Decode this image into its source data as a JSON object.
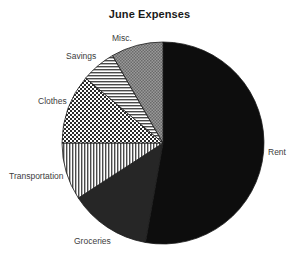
{
  "chart_data": {
    "type": "pie",
    "title": "June Expenses",
    "xlabel": "",
    "ylabel": "",
    "legend_position": "none",
    "grid": false,
    "start_angle_deg": 90,
    "direction": "clockwise",
    "categories": [
      "Rent",
      "Groceries",
      "Transportation",
      "Clothes",
      "Savings",
      "Misc."
    ],
    "values": [
      52.8,
      13.1,
      9.2,
      11.1,
      5.6,
      8.2
    ],
    "value_unit": "percent",
    "slices": [
      {
        "label": "Rent",
        "value": 52.8,
        "start_deg": 0,
        "end_deg": 190,
        "fill": "solid-black",
        "color": "#0d0d0d",
        "label_side": "right"
      },
      {
        "label": "Groceries",
        "value": 13.1,
        "start_deg": 190,
        "end_deg": 237,
        "fill": "solid-dark",
        "color": "#262626",
        "label_side": "bottom"
      },
      {
        "label": "Transportation",
        "value": 9.2,
        "start_deg": 237,
        "end_deg": 270,
        "fill": "vertical-lines",
        "color": "#6e6e6e",
        "label_side": "left"
      },
      {
        "label": "Clothes",
        "value": 11.1,
        "start_deg": 270,
        "end_deg": 310,
        "fill": "checkerboard",
        "color": "#5a5a5a",
        "label_side": "left"
      },
      {
        "label": "Savings",
        "value": 5.6,
        "start_deg": 310,
        "end_deg": 330,
        "fill": "horizontal-lines",
        "color": "#777777",
        "label_side": "upper-left"
      },
      {
        "label": "Misc.",
        "value": 8.2,
        "start_deg": 330,
        "end_deg": 360,
        "fill": "gray-crosshatch",
        "color": "#8a8a8a",
        "label_side": "top"
      }
    ],
    "center": {
      "x": 163,
      "y": 143
    },
    "radius": 101,
    "background": "#ffffff",
    "title_color": "#1a1a1a",
    "label_color": "#3d3d3d"
  }
}
